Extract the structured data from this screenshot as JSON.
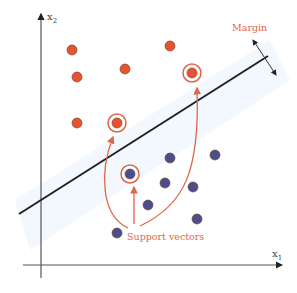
{
  "diagram": {
    "axes": {
      "x_label": "x",
      "x_sub": "1",
      "y_label": "x",
      "y_sub": "2"
    },
    "labels": {
      "margin": "Margin",
      "support_vectors": "Support vectors"
    },
    "colors": {
      "class_a": "#e8532f",
      "class_b": "#4a4f8c",
      "annotation": "#e0654a",
      "axis": "#555555",
      "hyperplane": "#222222"
    },
    "class_a_points": [
      {
        "x": 72,
        "y": 50,
        "support": false
      },
      {
        "x": 77,
        "y": 77,
        "support": false
      },
      {
        "x": 125,
        "y": 69,
        "support": false
      },
      {
        "x": 170,
        "y": 46,
        "support": false
      },
      {
        "x": 192,
        "y": 73,
        "support": true
      },
      {
        "x": 77,
        "y": 123,
        "support": false
      },
      {
        "x": 117,
        "y": 123,
        "support": true
      }
    ],
    "class_b_points": [
      {
        "x": 130,
        "y": 174,
        "support": true
      },
      {
        "x": 170,
        "y": 158,
        "support": false
      },
      {
        "x": 215,
        "y": 155,
        "support": false
      },
      {
        "x": 165,
        "y": 183,
        "support": false
      },
      {
        "x": 193,
        "y": 187,
        "support": false
      },
      {
        "x": 148,
        "y": 205,
        "support": false
      },
      {
        "x": 197,
        "y": 219,
        "support": false
      },
      {
        "x": 117,
        "y": 233,
        "support": false
      }
    ]
  }
}
